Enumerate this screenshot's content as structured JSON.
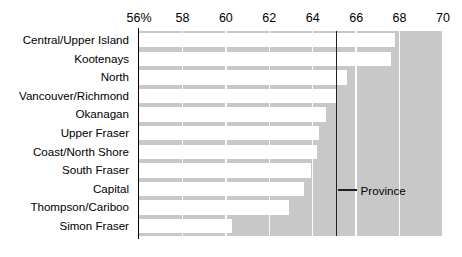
{
  "chart_data": {
    "type": "bar",
    "orientation": "horizontal",
    "title": "",
    "subtitle": "",
    "xlabel": "",
    "ylabel": "",
    "xlim": [
      56,
      70
    ],
    "xtick_labels": [
      "56%",
      "58",
      "60",
      "62",
      "64",
      "66",
      "68",
      "70"
    ],
    "xticks": [
      56,
      58,
      60,
      62,
      64,
      66,
      68,
      70
    ],
    "grid": true,
    "legend": "none",
    "bar_color": "#ffffff",
    "panel_color": "#c8c8c8",
    "categories": [
      "Central/Upper Island",
      "Kootenays",
      "North",
      "Vancouver/Richmond",
      "Okanagan",
      "Upper Fraser",
      "Coast/North Shore",
      "South Fraser",
      "Capital",
      "Thompson/Cariboo",
      "Simon Fraser"
    ],
    "values": [
      67.8,
      67.6,
      65.6,
      65.1,
      64.6,
      64.3,
      64.2,
      63.9,
      63.6,
      62.9,
      60.3
    ],
    "annotations": [
      {
        "label": "Province",
        "value": 65.1,
        "type": "reference-line",
        "color": "#231f20"
      }
    ]
  },
  "axis": {
    "ticks": [
      {
        "label": "56%",
        "value": 56
      },
      {
        "label": "58",
        "value": 58
      },
      {
        "label": "60",
        "value": 60
      },
      {
        "label": "62",
        "value": 62
      },
      {
        "label": "64",
        "value": 64
      },
      {
        "label": "66",
        "value": 66
      },
      {
        "label": "68",
        "value": 68
      },
      {
        "label": "70",
        "value": 70
      }
    ]
  },
  "province": {
    "label": "Province"
  }
}
